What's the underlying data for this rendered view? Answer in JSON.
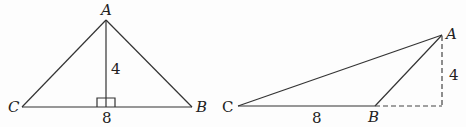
{
  "figures": [
    {
      "id": "left",
      "description": "Isosceles-looking triangle ABC with altitude from A to base CB",
      "vertices": {
        "A": {
          "label": "A",
          "x": 106,
          "y": 20
        },
        "B": {
          "label": "B",
          "x": 192,
          "y": 107
        },
        "C": {
          "label": "C",
          "x": 22,
          "y": 107
        }
      },
      "altitude_foot": {
        "x": 106,
        "y": 107
      },
      "right_angle_marker": true,
      "labels": {
        "height": "4",
        "base": "8"
      }
    },
    {
      "id": "right",
      "description": "Obtuse triangle ABC with external height from A to extension of CB",
      "vertices": {
        "A": {
          "label": "A",
          "x": 442,
          "y": 35
        },
        "B": {
          "label": "B",
          "x": 375,
          "y": 106
        },
        "C": {
          "label": "C",
          "x": 238,
          "y": 106
        }
      },
      "height_foot": {
        "x": 442,
        "y": 106
      },
      "labels": {
        "height": "4",
        "base": "8"
      }
    }
  ],
  "colors": {
    "stroke": "#333333",
    "text": "#222222",
    "background": "#fdfdfd"
  }
}
